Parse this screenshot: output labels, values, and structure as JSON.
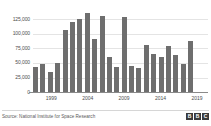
{
  "chart_data": {
    "type": "bar",
    "title": "",
    "subtitle": "",
    "xlabel": "",
    "ylabel": "",
    "ylim": [
      0,
      137500
    ],
    "ytick_values": [
      0,
      25000,
      50000,
      75000,
      100000,
      125000
    ],
    "ytick_labels": [
      "0",
      "25,000",
      "50,000",
      "75,000",
      "100,000",
      "125,000"
    ],
    "xtick_labels": [
      "1999",
      "2004",
      "2009",
      "2014",
      "2019"
    ],
    "xtick_categories": [
      "1999",
      "2004",
      "2009",
      "2014",
      "2019"
    ],
    "grid": true,
    "legend": null,
    "bar_color": "#6e6e6e",
    "categories": [
      "1997",
      "1998",
      "1999",
      "2000",
      "2001",
      "2002",
      "2003",
      "2004",
      "2005",
      "2006",
      "2007",
      "2008",
      "2009",
      "2010",
      "2011",
      "2012",
      "2013",
      "2014",
      "2015",
      "2016",
      "2017",
      "2018",
      "2019",
      "2020"
    ],
    "values": [
      43000,
      49000,
      34000,
      50000,
      107000,
      120000,
      125000,
      136000,
      92000,
      131000,
      61000,
      43000,
      129000,
      45000,
      42000,
      81000,
      65000,
      60000,
      80000,
      63000,
      48000,
      88000,
      0,
      0
    ],
    "series": [
      {
        "name": "Fire hotspots",
        "values": [
          43000,
          49000,
          34000,
          50000,
          107000,
          120000,
          125000,
          136000,
          92000,
          131000,
          61000,
          43000,
          129000,
          45000,
          42000,
          81000,
          65000,
          60000,
          80000,
          63000,
          48000,
          88000,
          0,
          0
        ]
      }
    ]
  },
  "axis": {
    "y_labels": [
      {
        "text": "125,000",
        "value": 125000
      },
      {
        "text": "100,000",
        "value": 100000
      },
      {
        "text": "75,000",
        "value": 75000
      },
      {
        "text": "50,000",
        "value": 50000
      },
      {
        "text": "25,000",
        "value": 25000
      },
      {
        "text": "0",
        "value": 0
      }
    ],
    "x_labels": [
      {
        "text": "1999",
        "index": 2
      },
      {
        "text": "2004",
        "index": 7
      },
      {
        "text": "2009",
        "index": 12
      },
      {
        "text": "2014",
        "index": 17
      },
      {
        "text": "2019",
        "index": 22
      }
    ]
  },
  "footer": {
    "source": "Source: National Institute for Space Research",
    "logo": [
      "B",
      "B",
      "C"
    ]
  }
}
